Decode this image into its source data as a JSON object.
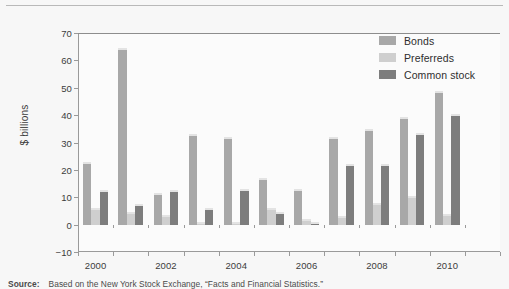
{
  "figure": {
    "background_color": "#f7f7f7",
    "plot_background_color": "#fbfbfb",
    "axis_color": "#9a9a9a"
  },
  "legend": {
    "position": "top-right",
    "entries": [
      {
        "label": "Bonds",
        "color": "#a8a8a8"
      },
      {
        "label": "Preferreds",
        "color": "#cfcfcf"
      },
      {
        "label": "Common stock",
        "color": "#7d7d7d"
      }
    ]
  },
  "caption": {
    "source_word": "Source:",
    "text": "Based on the New York Stock Exchange, “Facts and Financial Statistics.”"
  },
  "chart_data": {
    "type": "bar",
    "title": "",
    "subtitle": "",
    "xlabel": "",
    "ylabel": "$ billions",
    "ylim": [
      -10,
      70
    ],
    "ytick_values": [
      -10,
      0,
      10,
      20,
      30,
      40,
      50,
      60,
      70
    ],
    "ytick_labels": [
      "−10",
      "0",
      "10",
      "20",
      "30",
      "40",
      "50",
      "60",
      "70"
    ],
    "grid": false,
    "legend_position": "top-right",
    "categories": [
      "2000",
      "2001",
      "2002",
      "2003",
      "2004",
      "2005",
      "2006",
      "2007",
      "2008",
      "2009",
      "2010",
      "2011"
    ],
    "xtick_labels": [
      "2000",
      "2002",
      "2004",
      "2006",
      "2008",
      "2010"
    ],
    "xtick_label_categories": [
      "2000",
      "2002",
      "2004",
      "2006",
      "2008",
      "2010"
    ],
    "series": [
      {
        "name": "Bonds",
        "color": "#a8a8a8",
        "values": [
          23,
          64.5,
          11.5,
          33,
          32,
          17,
          13,
          32,
          35,
          39.5,
          49,
          0
        ]
      },
      {
        "name": "Preferreds",
        "color": "#cfcfcf",
        "values": [
          6,
          4.5,
          3.5,
          1,
          1,
          6,
          2,
          3,
          8,
          10.5,
          4,
          0
        ]
      },
      {
        "name": "Common stock",
        "color": "#7d7d7d",
        "values": [
          12.5,
          7.5,
          12.5,
          6,
          13,
          4.5,
          1,
          22,
          22,
          33.5,
          40.5,
          0
        ]
      }
    ]
  }
}
